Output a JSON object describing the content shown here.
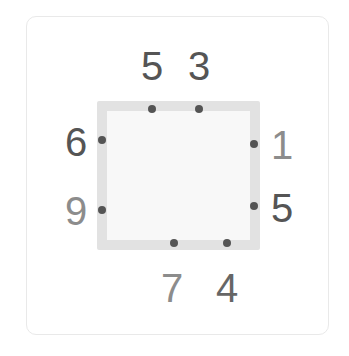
{
  "puzzle": {
    "top": [
      {
        "value": "5",
        "color": "#555555",
        "x": 152,
        "y": 66,
        "dot_x": 152,
        "dot_y": 109
      },
      {
        "value": "3",
        "color": "#555555",
        "x": 199,
        "y": 66,
        "dot_x": 199,
        "dot_y": 109
      }
    ],
    "right": [
      {
        "value": "1",
        "color": "#8c8c8c",
        "x": 282,
        "y": 145,
        "dot_x": 254,
        "dot_y": 144
      },
      {
        "value": "5",
        "color": "#555555",
        "x": 282,
        "y": 208,
        "dot_x": 254,
        "dot_y": 206
      }
    ],
    "bottom": [
      {
        "value": "7",
        "color": "#8c8c8c",
        "x": 172,
        "y": 288,
        "dot_x": 174,
        "dot_y": 243
      },
      {
        "value": "4",
        "color": "#666666",
        "x": 227,
        "y": 288,
        "dot_x": 227,
        "dot_y": 243
      }
    ],
    "left": [
      {
        "value": "6",
        "color": "#555555",
        "x": 76,
        "y": 142,
        "dot_x": 102,
        "dot_y": 140
      },
      {
        "value": "9",
        "color": "#8c8c8c",
        "x": 76,
        "y": 211,
        "dot_x": 102,
        "dot_y": 210
      }
    ]
  }
}
